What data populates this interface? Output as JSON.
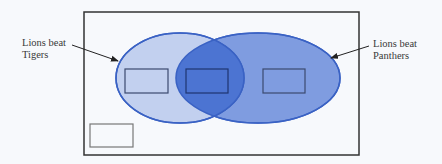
{
  "diagram": {
    "type": "venn",
    "universe": {
      "x": 84,
      "y": 12,
      "width": 275,
      "height": 143,
      "stroke": "#333333"
    },
    "sets": [
      {
        "id": "tigers",
        "label_line1": "Lions beat",
        "label_line2": "Tigers",
        "ellipse": {
          "cx": 180,
          "cy": 78,
          "rx": 64,
          "ry": 45
        },
        "fill": "#b9c9ec",
        "stroke": "#3a62c4"
      },
      {
        "id": "panthers",
        "label_line1": "Lions beat",
        "label_line2": "Panthers",
        "ellipse": {
          "cx": 258,
          "cy": 78,
          "rx": 82,
          "ry": 45
        },
        "fill": "#7f9ce0",
        "stroke": "#3a62c4"
      }
    ],
    "intersection_fill": "#4c74d2",
    "answer_boxes": [
      {
        "id": "tigers-only-box",
        "x": 125,
        "y": 69,
        "width": 43,
        "height": 24,
        "value": ""
      },
      {
        "id": "both-box",
        "x": 186,
        "y": 69,
        "width": 42,
        "height": 24,
        "value": ""
      },
      {
        "id": "panthers-only-box",
        "x": 263,
        "y": 69,
        "width": 42,
        "height": 24,
        "value": ""
      },
      {
        "id": "neither-box",
        "x": 90,
        "y": 124,
        "width": 43,
        "height": 23,
        "value": ""
      }
    ],
    "arrows": [
      {
        "id": "arrow-to-tigers",
        "x1": 72,
        "y1": 45,
        "x2": 118,
        "y2": 61
      },
      {
        "id": "arrow-to-panthers",
        "x1": 369,
        "y1": 46,
        "x2": 331,
        "y2": 58
      }
    ]
  }
}
